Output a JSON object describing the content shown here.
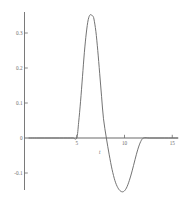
{
  "chart_data": {
    "type": "line",
    "title": "",
    "xlabel": "t",
    "ylabel": "",
    "xlim": [
      0,
      15.6
    ],
    "ylim": [
      -0.175,
      0.385
    ],
    "grid": false,
    "legend": null,
    "xticks": [
      5,
      10,
      15
    ],
    "xtick_labels": [
      "5",
      "10",
      "15"
    ],
    "yticks": [
      -0.1,
      0,
      0.1,
      0.2,
      0.3
    ],
    "ytick_labels": [
      "-0.1",
      "0",
      "0.1",
      "0.2",
      "0.3"
    ],
    "series": [
      {
        "name": "pulse",
        "color": "#6b6b6b",
        "x": [
          0.0,
          0.8,
          1.6,
          2.4,
          3.2,
          4.0,
          4.6,
          5.0,
          5.2,
          5.4,
          5.6,
          5.8,
          6.0,
          6.2,
          6.4,
          6.6,
          6.7,
          6.8,
          7.0,
          7.2,
          7.4,
          7.6,
          7.8,
          8.1,
          8.4,
          8.7,
          9.0,
          9.3,
          9.6,
          9.9,
          10.2,
          10.5,
          10.8,
          11.1,
          11.4,
          11.7,
          12.0,
          12.6,
          13.4,
          14.2,
          15.0,
          15.6
        ],
        "y": [
          0.0,
          0.0,
          0.0,
          0.0,
          0.0,
          0.0,
          0.0,
          0.0,
          0.045,
          0.105,
          0.175,
          0.245,
          0.3,
          0.338,
          0.352,
          0.35,
          0.348,
          0.34,
          0.305,
          0.25,
          0.185,
          0.118,
          0.055,
          0.0,
          -0.048,
          -0.09,
          -0.122,
          -0.142,
          -0.152,
          -0.153,
          -0.143,
          -0.122,
          -0.094,
          -0.062,
          -0.032,
          -0.01,
          0.0,
          0.0,
          0.0,
          0.0,
          0.0,
          0.0
        ]
      }
    ],
    "axis_color": "#6b6b6b",
    "background": "#ffffff"
  },
  "axes": {
    "x_axis_name": "x-axis-zero-line",
    "y_axis_name": "y-axis-line"
  }
}
